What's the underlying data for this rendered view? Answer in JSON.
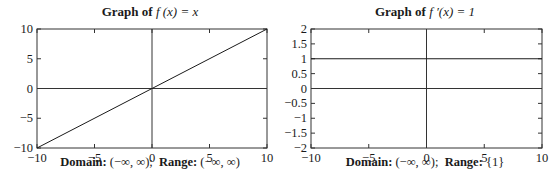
{
  "chart_data": [
    {
      "type": "line",
      "title": "Graph of f(x) = x",
      "title_prefix": "Graph of",
      "title_math": "f (x) = x",
      "xlabel": "",
      "ylabel": "",
      "xlim": [
        -10,
        10
      ],
      "ylim": [
        -10,
        10
      ],
      "xticks": [
        -10,
        -5,
        0,
        5,
        10
      ],
      "yticks": [
        -10,
        -5,
        0,
        5,
        10
      ],
      "xtick_labels": [
        "−10",
        "−5",
        "0",
        "5",
        "10"
      ],
      "ytick_labels": [
        "−10",
        "−5",
        "0",
        "5",
        "10"
      ],
      "grid": false,
      "axes_through_origin": true,
      "series": [
        {
          "name": "f(x) = x",
          "x": [
            -10,
            10
          ],
          "y": [
            -10,
            10
          ]
        }
      ],
      "caption": {
        "domain_label": "Domain:",
        "domain_value": "(−∞, ∞);",
        "range_label": "Range:",
        "range_value": "(−∞, ∞)"
      }
    },
    {
      "type": "line",
      "title": "Graph of f′(x) = 1",
      "title_prefix": "Graph of",
      "title_math": "f ′(x) = 1",
      "xlabel": "",
      "ylabel": "",
      "xlim": [
        -10,
        10
      ],
      "ylim": [
        -2,
        2
      ],
      "xticks": [
        -10,
        -5,
        0,
        5,
        10
      ],
      "yticks": [
        -2,
        -1.5,
        -1,
        -0.5,
        0,
        0.5,
        1,
        1.5,
        2
      ],
      "xtick_labels": [
        "−10",
        "−5",
        "0",
        "5",
        "10"
      ],
      "ytick_labels": [
        "−2",
        "−1.5",
        "−1",
        "−0.5",
        "0",
        "0.5",
        "1",
        "1.5",
        "2"
      ],
      "grid": false,
      "axes_through_origin": true,
      "series": [
        {
          "name": "f′(x) = 1",
          "x": [
            -10,
            10
          ],
          "y": [
            1,
            1
          ]
        }
      ],
      "caption": {
        "domain_label": "Domain:",
        "domain_value": "(−∞, ∞);",
        "range_label": "Range:",
        "range_value": "{1}"
      }
    }
  ],
  "colors": {
    "line": "#1a1a1a",
    "frame": "#333333",
    "background": "#ffffff"
  }
}
